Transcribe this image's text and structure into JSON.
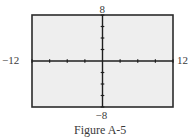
{
  "chart_data": {
    "type": "line",
    "title": "",
    "caption": "Figure A-5",
    "xlabel": "",
    "ylabel": "",
    "xlim": [
      -12,
      12
    ],
    "ylim": [
      -8,
      8
    ],
    "x_tick_step": 3,
    "y_tick_step": 2,
    "grid": false,
    "series": [],
    "tick_labels": {
      "x_min": "−12",
      "x_max": "12",
      "y_min": "−8",
      "y_max": "8"
    },
    "colors": {
      "frame": "#2b2b2b",
      "axes": "#1f1f1f",
      "plot_background": "#eeeeee",
      "text": "#3a3a3a"
    }
  }
}
